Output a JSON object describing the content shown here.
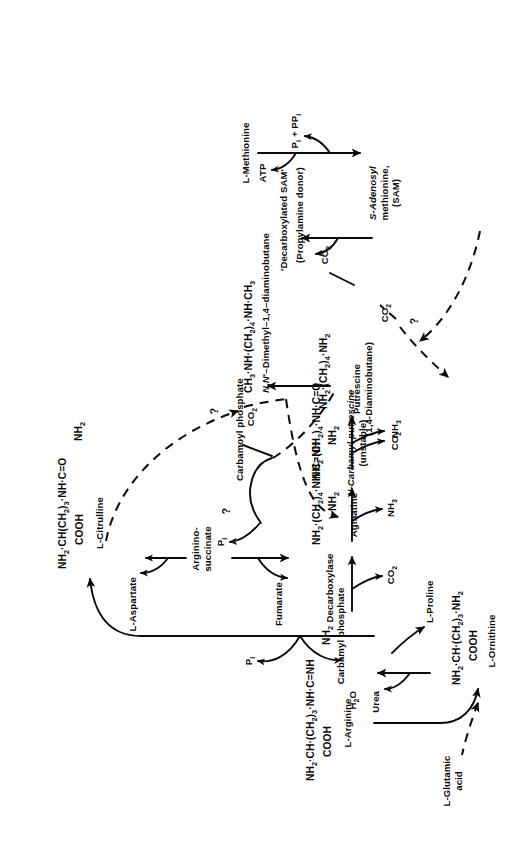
{
  "figure": {
    "orientation": "page rotated 90 degrees counter-clockwise (landscape figure on portrait page)",
    "ink_color": "#0a0a0a",
    "background_color": "#ffffff"
  },
  "metabolites": {
    "carbamyl_phosphate": "Carbamyl phosphate",
    "carbamoyl_phosphate": "Carbamoyl phosphate",
    "pi": "Pi",
    "l_aspartate": "L-Aspartate",
    "arginino_succinate_l1": "Arginino-",
    "arginino_succinate_l2": "succinate",
    "fumarate": "Fumarate",
    "citrulline_struct_l1": "NH2·CH(CH2)3·NH·C=O",
    "citrulline_struct_l2": "COOH",
    "citrulline_struct_l3": "NH2",
    "citrulline_name": "L-Citrulline",
    "arginine_struct_l1": "NH2·CH·(CH2)3·NH·C=NH",
    "arginine_struct_l2": "COOH",
    "arginine_struct_l3": "NH2",
    "arginine_name": "L-Arginine",
    "decarboxylase": "Decarboxylase",
    "co2": "CO2",
    "agmatine_struct_l1": "NH2·(CH2)4·NH·C=NH",
    "agmatine_struct_l2": "NH2",
    "agmatine_name": "Agmatine",
    "nh3": "NH3",
    "carbamyl_putrescine_struct_l1": "NH2·(CH2)4·NH·C=O",
    "carbamyl_putrescine_struct_l2": "NH2",
    "carbamyl_putrescine_name_l1": "N-Carbamyl putrescine",
    "carbamyl_putrescine_name_l2": "(unstable)",
    "putrescine_struct": "NH2·(CH2)4·NH2",
    "putrescine_name_l1": "Putrescine",
    "putrescine_name_l2": "(1,4-Diaminobutane)",
    "dimethyl_struct": "CH3·NH·(CH2)4·NH·CH3",
    "dimethyl_name": "N,N'-Dimethyl-1,4-diaminobutane",
    "urea": "Urea",
    "water": "H2O",
    "ornithine_struct_l1": "NH2·CH·(CH2)3·NH2",
    "ornithine_struct_l2": "COOH",
    "ornithine_name": "L-Ornithine",
    "glutamic_acid_l1": "L-Glutamic",
    "glutamic_acid_l2": "acid",
    "proline": "L-Proline",
    "methionine": "L-Methionine",
    "atp": "ATP",
    "pi_ppi": "Pi + PPi",
    "sam_l1": "S-Adenosyl",
    "sam_l2": "methionine,",
    "sam_l3": "(SAM)",
    "decarb_sam_l1": "'Decarboxylated SAM'",
    "decarb_sam_l2": "(Propylamine donor)",
    "question_mark": "?"
  },
  "annotations": {
    "unknown_steps": [
      "?",
      "?",
      "?"
    ],
    "dashed_relations": [
      "L-Glutamic acid to L-Ornithine",
      "L-Citrulline to CO2 branch",
      "Putrescine to CO2 branch",
      "Carbamoyl phosphate region to Putrescine"
    ]
  }
}
